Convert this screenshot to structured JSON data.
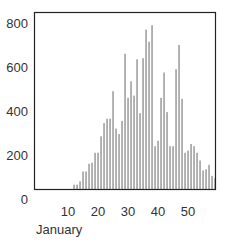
{
  "chart_data": {
    "type": "bar",
    "title": "",
    "xlabel": "January",
    "ylabel": "",
    "x_ticks": [
      10,
      20,
      30,
      40,
      50
    ],
    "y_ticks": [
      0,
      200,
      400,
      600,
      800
    ],
    "ylim": [
      0,
      800
    ],
    "xlim": [
      0,
      60
    ],
    "grid": false,
    "legend": null,
    "x": [
      12,
      13,
      14,
      15,
      16,
      17,
      18,
      19,
      20,
      21,
      22,
      23,
      24,
      25,
      26,
      27,
      28,
      29,
      30,
      31,
      32,
      33,
      34,
      35,
      36,
      37,
      38,
      39,
      40,
      41,
      42,
      43,
      44,
      45,
      46,
      47,
      48,
      49,
      50,
      51,
      52,
      53,
      54,
      55,
      56,
      57,
      58,
      59
    ],
    "values": [
      65,
      65,
      80,
      125,
      125,
      160,
      165,
      210,
      210,
      285,
      345,
      365,
      365,
      490,
      320,
      295,
      355,
      660,
      460,
      535,
      470,
      635,
      390,
      640,
      770,
      715,
      790,
      240,
      265,
      460,
      575,
      395,
      240,
      240,
      590,
      700,
      455,
      210,
      220,
      250,
      240,
      210,
      175,
      130,
      135,
      155,
      105,
      95
    ],
    "bar_color": "#8a8a8a",
    "axis_color": "#222222"
  }
}
